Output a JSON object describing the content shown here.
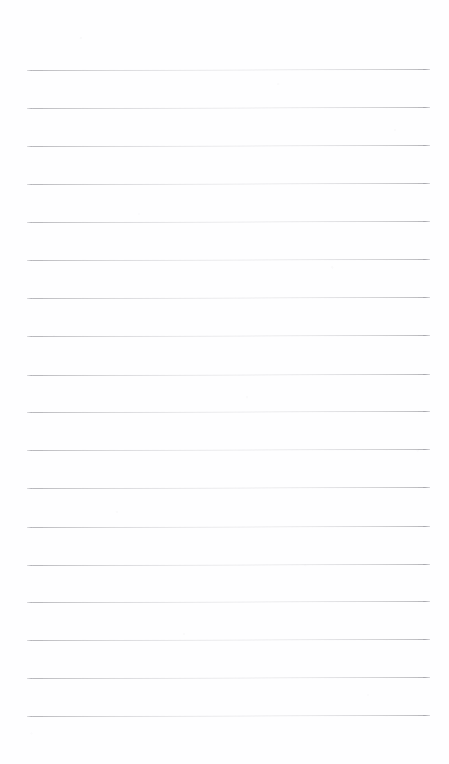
{
  "page": {
    "kind": "blank-lined-notepad-page",
    "width": 449,
    "height": 764,
    "background_color": "#fefeff",
    "text_content": "",
    "has_handwriting": false,
    "has_printed_text": false,
    "has_margin_rule": false
  },
  "ruling": {
    "line_color": "#b9b9bd",
    "line_thickness_px": 1,
    "line_count": 18,
    "left_x": 27,
    "right_x": 430,
    "line_length_px": 403,
    "first_line_y": 70,
    "last_line_y": 716,
    "line_spacing_px": 38,
    "top_margin_px": 70,
    "bottom_margin_px": 48,
    "left_margin_px": 27,
    "right_margin_px": 19,
    "lines": [
      {
        "index": 1,
        "y": 70,
        "slope_px": -1
      },
      {
        "index": 2,
        "y": 108,
        "slope_px": -1
      },
      {
        "index": 3,
        "y": 146,
        "slope_px": -1
      },
      {
        "index": 4,
        "y": 184,
        "slope_px": -1
      },
      {
        "index": 5,
        "y": 222,
        "slope_px": -1
      },
      {
        "index": 6,
        "y": 260,
        "slope_px": -1
      },
      {
        "index": 7,
        "y": 298,
        "slope_px": -1
      },
      {
        "index": 8,
        "y": 336,
        "slope_px": -1
      },
      {
        "index": 9,
        "y": 375,
        "slope_px": -1
      },
      {
        "index": 10,
        "y": 412,
        "slope_px": -1
      },
      {
        "index": 11,
        "y": 450,
        "slope_px": -1
      },
      {
        "index": 12,
        "y": 488,
        "slope_px": -1
      },
      {
        "index": 13,
        "y": 527,
        "slope_px": -1
      },
      {
        "index": 14,
        "y": 565,
        "slope_px": -1
      },
      {
        "index": 15,
        "y": 602,
        "slope_px": -1
      },
      {
        "index": 16,
        "y": 640,
        "slope_px": -1
      },
      {
        "index": 17,
        "y": 678,
        "slope_px": -1
      },
      {
        "index": 18,
        "y": 716,
        "slope_px": -1
      }
    ]
  }
}
